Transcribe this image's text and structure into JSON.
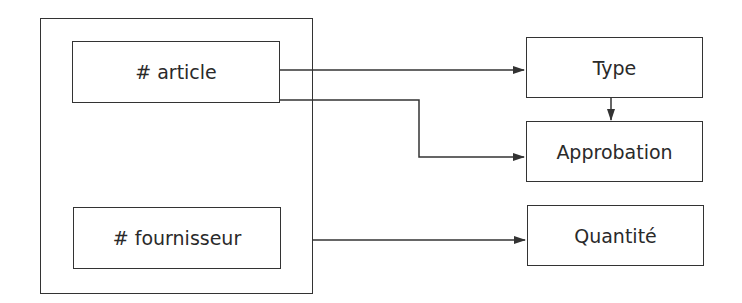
{
  "diagram": {
    "container": {
      "label": ""
    },
    "keys": [
      {
        "id": "article",
        "label": "# article"
      },
      {
        "id": "fournisseur",
        "label": "# fournisseur"
      }
    ],
    "attributes": [
      {
        "id": "type",
        "label": "Type"
      },
      {
        "id": "approbation",
        "label": "Approbation"
      },
      {
        "id": "quantite",
        "label": "Quantité"
      }
    ],
    "edges": [
      {
        "from": "article",
        "to": "type"
      },
      {
        "from": "article",
        "to": "approbation"
      },
      {
        "from": "type",
        "to": "approbation"
      },
      {
        "from": "container",
        "to": "quantite"
      }
    ],
    "colors": {
      "line": "#333333",
      "background": "#ffffff"
    }
  }
}
